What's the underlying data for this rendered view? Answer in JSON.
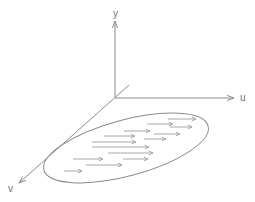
{
  "figure": {
    "title": "",
    "background_color": "#ffffff",
    "axis_color": "#8c8c8c",
    "arrow_color": "#a8a8a8",
    "label_color": "#6f6f6f",
    "origin": {
      "x": 115,
      "y": 98
    }
  },
  "axes": [
    {
      "id": "y-axis",
      "label": "y",
      "label_x": 113,
      "label_y": 17,
      "from": {
        "x": 115,
        "y": 98
      },
      "to": {
        "x": 115,
        "y": 21
      },
      "arrowhead": true,
      "direction": "up"
    },
    {
      "id": "u-axis",
      "label": "u",
      "label_x": 240,
      "label_y": 101,
      "from": {
        "x": 115,
        "y": 98
      },
      "to": {
        "x": 234,
        "y": 98
      },
      "arrowhead": true,
      "direction": "right"
    },
    {
      "id": "v-axis",
      "label": "v",
      "label_x": 8,
      "label_y": 192,
      "from": {
        "x": 129,
        "y": 85
      },
      "to": {
        "x": 19,
        "y": 183
      },
      "arrowhead": true,
      "direction": "down-left"
    }
  ],
  "region": {
    "id": "flow-ellipse",
    "shape": "ellipse",
    "center": {
      "x": 126,
      "y": 148
    },
    "radius_x": 85,
    "radius_y": 28,
    "rotation_deg": -15
  },
  "flow_arrows": [
    {
      "x1": 168,
      "y1": 119,
      "x2": 196,
      "y2": 119
    },
    {
      "x1": 147,
      "y1": 124,
      "x2": 173,
      "y2": 124
    },
    {
      "x1": 170,
      "y1": 127,
      "x2": 192,
      "y2": 127
    },
    {
      "x1": 124,
      "y1": 131,
      "x2": 150,
      "y2": 131
    },
    {
      "x1": 154,
      "y1": 134,
      "x2": 180,
      "y2": 134
    },
    {
      "x1": 104,
      "y1": 136,
      "x2": 135,
      "y2": 136
    },
    {
      "x1": 144,
      "y1": 139,
      "x2": 166,
      "y2": 139
    },
    {
      "x1": 92,
      "y1": 142,
      "x2": 136,
      "y2": 142
    },
    {
      "x1": 92,
      "y1": 147,
      "x2": 149,
      "y2": 147
    },
    {
      "x1": 108,
      "y1": 153,
      "x2": 153,
      "y2": 153
    },
    {
      "x1": 73,
      "y1": 159,
      "x2": 103,
      "y2": 159
    },
    {
      "x1": 123,
      "y1": 159,
      "x2": 148,
      "y2": 159
    },
    {
      "x1": 86,
      "y1": 165,
      "x2": 122,
      "y2": 165
    },
    {
      "x1": 64,
      "y1": 171,
      "x2": 82,
      "y2": 171
    }
  ]
}
